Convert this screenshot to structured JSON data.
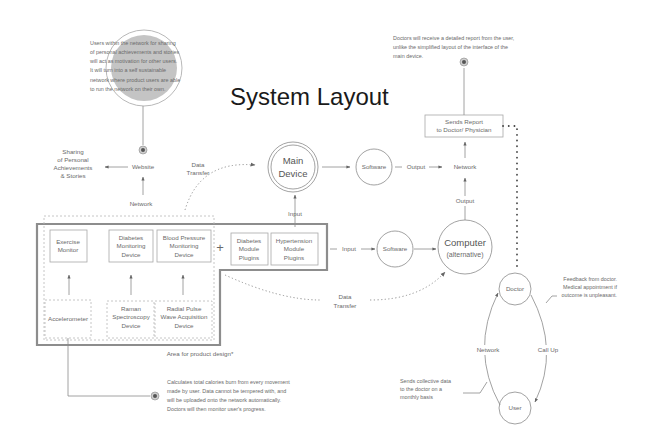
{
  "title": "System Layout",
  "notes": {
    "users_network": [
      "Users within the network for sharing",
      "of personal achievements and stories",
      "will act as motivation for other users.",
      "It will turn into a self sustainable",
      "network where product users are able",
      "to run the network on their own."
    ],
    "doctor_report": [
      "Doctors will receive a detailed report from the user,",
      "unlike the simplified layout of the interface of the",
      "main device."
    ],
    "accelerometer": [
      "Calculates total calories burn from every movement",
      "made by user. Data cannot be tempered with, and",
      "will be uploaded onto the network automatically.",
      "Doctors will then monitor user's progress."
    ],
    "feedback": [
      "Feedback from doctor.",
      "Medical appointment if",
      "outcome is unpleasant."
    ],
    "collective": [
      "Sends collective data",
      "to the doctor on a",
      "monthly basis"
    ]
  },
  "nodes": {
    "sharing": [
      "Sharing",
      "of Personal",
      "Achievements",
      "& Stories"
    ],
    "website": "Website",
    "main_device": [
      "Main",
      "Device"
    ],
    "software_top": "Software",
    "software_mid": "Software",
    "network_right": "Network",
    "computer": [
      "Computer",
      "(alternative)"
    ],
    "sends_report": [
      "Sends Report",
      "to Doctor/ Physician"
    ],
    "doctor": "Doctor",
    "user": "User"
  },
  "devices": {
    "exercise_monitor": [
      "Exercise",
      "Monitor"
    ],
    "diabetes_monitoring": [
      "Diabetes",
      "Monitoring",
      "Device"
    ],
    "blood_pressure": [
      "Blood Pressure",
      "Monitoring",
      "Device"
    ],
    "diabetes_plugins": [
      "Diabetes",
      "Module",
      "Plugins"
    ],
    "hypertension_plugins": [
      "Hypertension",
      "Module",
      "Plugins"
    ],
    "accelerometer": "Accelerometer",
    "raman": [
      "Raman",
      "Spectroscopy",
      "Device"
    ],
    "radial_pulse": [
      "Radial Pulse",
      "Wave Acquisition",
      "Device"
    ],
    "plus": "+"
  },
  "labels": {
    "network_left": "Network",
    "data_transfer_top": [
      "Data",
      "Transfer"
    ],
    "data_transfer_bottom": [
      "Data",
      "Transfer"
    ],
    "input_main": "Input",
    "input_software": "Input",
    "output_top": "Output",
    "output_vertical": "Output",
    "area_caption": "Area for product design*",
    "loop_network": "Network",
    "loop_callup": "Call Up"
  }
}
